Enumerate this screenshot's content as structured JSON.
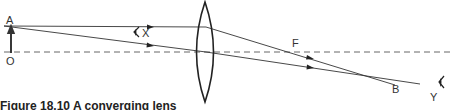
{
  "diagram": {
    "type": "ray-diagram-converging-lens",
    "labels": {
      "object_top": "A",
      "object_base": "O",
      "eye_near": "X",
      "focal_point": "F",
      "image_point": "B",
      "eye_far": "Y"
    },
    "caption": "Figure 18.10  A converging lens",
    "colors": {
      "line": "#333333",
      "axis_dash": "#555555",
      "background": "#ffffff"
    }
  }
}
